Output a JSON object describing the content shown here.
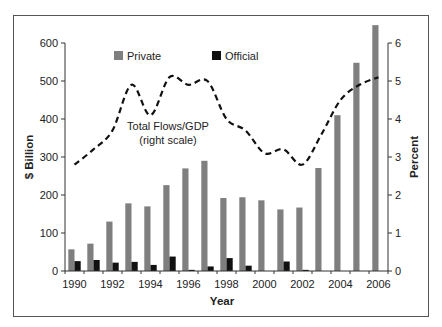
{
  "chart_data": {
    "type": "bar",
    "title": "",
    "xlabel": "Year",
    "ylabel": "$ Billion",
    "y2label": "Percent",
    "ylim": [
      0,
      600
    ],
    "y2lim": [
      0,
      6
    ],
    "yticks": [
      "0",
      "100",
      "200",
      "300",
      "400",
      "500",
      "600"
    ],
    "y2ticks": [
      "0",
      "1",
      "2",
      "3",
      "4",
      "5",
      "6"
    ],
    "xtick_labels": [
      "1990",
      "1992",
      "1994",
      "1996",
      "1998",
      "2000",
      "2002",
      "2004",
      "2006"
    ],
    "categories": [
      "1990",
      "1991",
      "1992",
      "1993",
      "1994",
      "1995",
      "1996",
      "1997",
      "1998",
      "1999",
      "2000",
      "2001",
      "2002",
      "2003",
      "2004",
      "2005",
      "2006"
    ],
    "series": [
      {
        "name": "Private",
        "type": "bar",
        "axis": "left",
        "color": "#7f7f7f",
        "values": [
          57,
          72,
          130,
          178,
          170,
          226,
          270,
          290,
          192,
          194,
          186,
          162,
          167,
          271,
          410,
          548,
          647
        ]
      },
      {
        "name": "Official",
        "type": "bar",
        "axis": "left",
        "color": "#111111",
        "values": [
          26,
          29,
          22,
          24,
          16,
          38,
          3,
          12,
          34,
          14,
          0,
          25,
          3,
          0,
          0,
          0,
          0
        ]
      },
      {
        "name": "Total Flows/GDP",
        "type": "line",
        "axis": "right",
        "style": "dashed",
        "color": "#111111",
        "values": [
          2.8,
          3.2,
          3.7,
          4.9,
          4.1,
          5.1,
          4.9,
          5.0,
          4.0,
          3.7,
          3.1,
          3.2,
          2.8,
          3.6,
          4.5,
          4.9,
          5.1
        ]
      }
    ],
    "legend": {
      "position": "top-inside",
      "entries": [
        "Private",
        "Official"
      ]
    },
    "annotations": [
      {
        "text_line1": "Total Flows/GDP",
        "text_line2": "(right scale)"
      }
    ],
    "grid": false
  },
  "labels": {
    "legend_private": "Private",
    "legend_official": "Official",
    "annotation_line1": "Total Flows/GDP",
    "annotation_line2": "(right scale)",
    "x_axis_title": "Year",
    "y_axis_title": "$ Billion",
    "y2_axis_title": "Percent"
  }
}
